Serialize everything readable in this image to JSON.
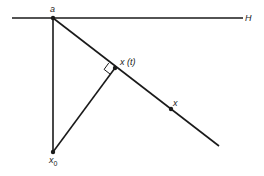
{
  "diagram": {
    "labels": {
      "hyperplane": "H",
      "point_a": "a",
      "point_xt": "x (t)",
      "point_x": "x",
      "point_x0_base": "x",
      "point_x0_sub": "0"
    },
    "colors": {
      "stroke": "#1a1a1a",
      "background": "#ffffff"
    }
  }
}
